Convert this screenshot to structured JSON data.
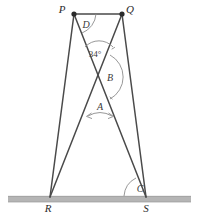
{
  "figure": {
    "background_color": "#ffffff",
    "line_color": "#4a4a4a",
    "arc_color": "#8c8c8c",
    "ground_color": "#b5b5b5"
  },
  "vertices": [
    {
      "id": "P",
      "label": "P",
      "x": 74,
      "y": 14,
      "label_x": 62,
      "label_y": 12
    },
    {
      "id": "Q",
      "label": "Q",
      "x": 122,
      "y": 14,
      "label_x": 128,
      "label_y": 12
    },
    {
      "id": "R",
      "label": "R",
      "x": 50,
      "y": 197,
      "label_x": 47,
      "label_y": 211
    },
    {
      "id": "S",
      "label": "S",
      "x": 146,
      "y": 197,
      "label_x": 144,
      "label_y": 211
    }
  ],
  "angles": [
    {
      "id": "D",
      "label": "D",
      "label_x": 84,
      "label_y": 26
    },
    {
      "id": "angle34",
      "label": "34°",
      "label_x": 88,
      "label_y": 55
    },
    {
      "id": "B",
      "label": "B",
      "label_x": 108,
      "label_y": 81
    },
    {
      "id": "A",
      "label": "A",
      "label_x": 97,
      "label_y": 111
    },
    {
      "id": "C",
      "label": "C",
      "label_x": 139,
      "label_y": 192
    }
  ],
  "segments": [
    {
      "id": "PQ",
      "from": "P",
      "to": "Q"
    },
    {
      "id": "PR",
      "from": "P",
      "to": "R"
    },
    {
      "id": "PS",
      "from": "P",
      "to": "S"
    },
    {
      "id": "QR",
      "from": "Q",
      "to": "R"
    },
    {
      "id": "QS",
      "from": "Q",
      "to": "S"
    }
  ],
  "ground": {
    "id": "ground-line",
    "x_start": 8,
    "x_end": 191,
    "y": 199
  },
  "intersection": {
    "id": "X",
    "x": 99,
    "y": 77
  }
}
